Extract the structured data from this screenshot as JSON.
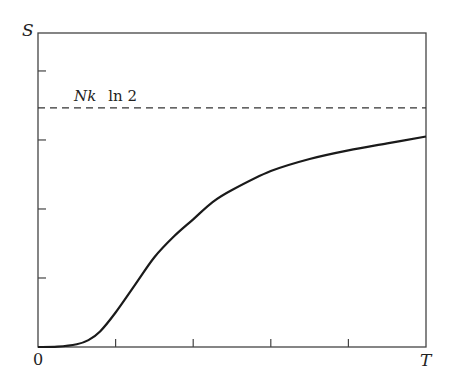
{
  "chart_data": {
    "type": "line",
    "title": "",
    "xlabel": "T",
    "ylabel": "S",
    "x_origin_label": "0",
    "xlim": [
      0,
      1
    ],
    "ylim": [
      0,
      0.91
    ],
    "grid": false,
    "x_ticks": [
      0.2,
      0.4,
      0.6,
      0.8
    ],
    "y_ticks": [
      0.2,
      0.4,
      0.6,
      0.8
    ],
    "tick_labels_shown": false,
    "annotations": [
      {
        "text_italic": "Nk",
        "text_roman": "ln 2",
        "y": 0.693,
        "style": "dashed horizontal asymptote"
      }
    ],
    "series": [
      {
        "name": "S(T)",
        "style": "solid",
        "x": [
          0.0,
          0.05,
          0.1,
          0.13,
          0.16,
          0.2,
          0.25,
          0.3,
          0.35,
          0.4,
          0.45,
          0.5,
          0.6,
          0.7,
          0.8,
          0.9,
          1.0
        ],
        "y": [
          0.0,
          0.001,
          0.008,
          0.02,
          0.045,
          0.1,
          0.18,
          0.26,
          0.32,
          0.37,
          0.42,
          0.455,
          0.51,
          0.545,
          0.57,
          0.59,
          0.61
        ]
      }
    ]
  }
}
